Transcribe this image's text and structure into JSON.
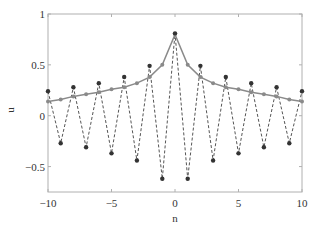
{
  "chart_data": {
    "type": "line",
    "title": "",
    "xlabel": "n",
    "ylabel": "u",
    "xlim": [
      -10,
      10
    ],
    "ylim": [
      -0.75,
      1
    ],
    "xticks": [
      -10,
      -5,
      0,
      5,
      10
    ],
    "xtick_labels": [
      "−10",
      "−5",
      "0",
      "5",
      "10"
    ],
    "yticks": [
      1,
      0.5,
      0,
      -0.5
    ],
    "ytick_labels": [
      "1",
      "0.5",
      "0",
      "−0.5"
    ],
    "grid": false,
    "legend": null,
    "series": [
      {
        "name": "envelope",
        "style": "solid gray line with gray circle markers",
        "color": "#8a8a8a",
        "x": [
          -10,
          -9,
          -8,
          -7,
          -6,
          -5,
          -4,
          -3,
          -2,
          -1,
          0,
          1,
          2,
          3,
          4,
          5,
          6,
          7,
          8,
          9,
          10
        ],
        "values": [
          0.14,
          0.16,
          0.19,
          0.21,
          0.23,
          0.26,
          0.28,
          0.32,
          0.38,
          0.5,
          0.8,
          0.5,
          0.38,
          0.32,
          0.28,
          0.26,
          0.23,
          0.21,
          0.19,
          0.16,
          0.14
        ]
      },
      {
        "name": "alternating solution",
        "style": "dashed dark line with black circle markers",
        "color": "#333333",
        "x": [
          -10,
          -9,
          -8,
          -7,
          -6,
          -5,
          -4,
          -3,
          -2,
          -1,
          0,
          1,
          2,
          3,
          4,
          5,
          6,
          7,
          8,
          9,
          10
        ],
        "values": [
          0.24,
          -0.27,
          0.28,
          -0.31,
          0.32,
          -0.37,
          0.38,
          -0.44,
          0.49,
          -0.62,
          0.81,
          -0.62,
          0.49,
          -0.44,
          0.38,
          -0.37,
          0.32,
          -0.31,
          0.28,
          -0.27,
          0.24
        ]
      }
    ]
  }
}
